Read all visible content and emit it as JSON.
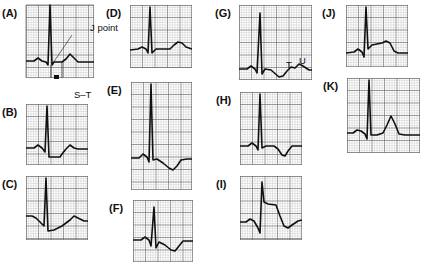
{
  "figure": {
    "grid": {
      "minor_color": "#b9b9b9",
      "major_color": "#6e6e6e",
      "background": "#ffffff",
      "trace_color": "#111111"
    },
    "panels": [
      {
        "id": "A",
        "label": "(A)",
        "x": 26,
        "y": 5,
        "w": 68,
        "h": 73,
        "annotations": [
          {
            "text": "J point",
            "x": 64,
            "y": 17
          },
          {
            "text": "S–T",
            "x": 48,
            "y": 84
          }
        ],
        "points": "0,56 8,56 12,53 16,56 20,57 22,60 24,0 26,60 28,57 36,57 40,54 44,49 48,53 52,57 68,57"
      },
      {
        "id": "B",
        "label": "(B)",
        "x": 26,
        "y": 104,
        "w": 62,
        "h": 61,
        "points": "0,44 8,44 12,41 16,44 19,48 21,2 23,53 34,53 36,50 40,45 44,41 48,44 52,45 62,45"
      },
      {
        "id": "C",
        "label": "(C)",
        "x": 26,
        "y": 176,
        "w": 62,
        "h": 64,
        "points": "0,40 6,40 10,42 14,46 18,50 20,2 22,55 28,54 36,50 44,44 48,40 52,42 58,45 62,45"
      },
      {
        "id": "D",
        "label": "(D)",
        "x": 130,
        "y": 5,
        "w": 62,
        "h": 63,
        "points": "0,45 8,44 12,42 16,44 18,48 20,2 22,48 26,44 40,44 44,40 48,37 52,38 56,42 62,44"
      },
      {
        "id": "E",
        "label": "(E)",
        "x": 131,
        "y": 82,
        "w": 61,
        "h": 108,
        "points": "0,76 8,76 12,72 16,75 18,80 20,2 22,78 26,77 32,81 38,86 42,88 46,84 50,78 56,77 61,77"
      },
      {
        "id": "F",
        "label": "(F)",
        "x": 133,
        "y": 200,
        "w": 60,
        "h": 62,
        "points": "0,40 8,40 12,37 16,40 18,46 21,7 23,48 26,42 32,45 38,50 42,51 46,46 50,41 56,41 60,41"
      },
      {
        "id": "G",
        "label": "(G)",
        "x": 239,
        "y": 5,
        "w": 73,
        "h": 75,
        "annotations": [
          {
            "text": "T",
            "x": 47,
            "y": 54
          },
          {
            "text": "U",
            "x": 60,
            "y": 50
          }
        ],
        "points": "0,64 8,64 12,61 16,64 18,68 21,8 23,69 26,64 32,65 40,72 44,71 48,66 52,62 56,63 60,59 64,61 70,65 73,65"
      },
      {
        "id": "H",
        "label": "(H)",
        "x": 240,
        "y": 92,
        "w": 62,
        "h": 73,
        "points": "0,54 8,54 12,51 16,54 18,58 20,2 22,56 26,54 34,54 38,57 42,63 45,64 48,59 52,54 62,54"
      },
      {
        "id": "I",
        "label": "(I)",
        "x": 240,
        "y": 176,
        "w": 62,
        "h": 64,
        "points": "0,46 6,46 10,43 14,45 18,52 20,57 22,6 24,26 28,28 36,29 40,40 44,50 48,52 52,49 58,45 62,44"
      },
      {
        "id": "J",
        "label": "(J)",
        "x": 346,
        "y": 5,
        "w": 62,
        "h": 62,
        "points": "0,48 8,47 12,44 16,47 18,52 20,2 22,44 26,40 36,38 40,36 44,38 48,46 52,48 62,48"
      },
      {
        "id": "K",
        "label": "(K)",
        "x": 347,
        "y": 78,
        "w": 73,
        "h": 75,
        "points": "0,55 6,55 10,52 14,53 18,56 20,61 22,2 24,57 30,57 36,55 40,47 44,38 48,46 52,56 58,57 73,57"
      }
    ]
  }
}
